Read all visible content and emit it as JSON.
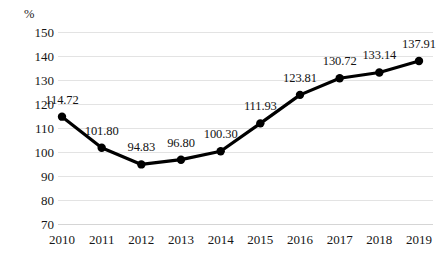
{
  "chart_data": {
    "type": "line",
    "title": "",
    "subtitle": "",
    "xlabel": "",
    "ylabel": "%",
    "unit_label": "%",
    "categories": [
      "2010",
      "2011",
      "2012",
      "2013",
      "2014",
      "2015",
      "2016",
      "2017",
      "2018",
      "2019"
    ],
    "values": [
      114.72,
      101.8,
      94.83,
      96.8,
      100.3,
      111.93,
      123.81,
      130.72,
      133.14,
      137.91
    ],
    "data_labels": [
      "114.72",
      "101.80",
      "94.83",
      "96.80",
      "100.30",
      "111.93",
      "123.81",
      "130.72",
      "133.14",
      "137.91"
    ],
    "ylim": [
      70,
      150
    ],
    "y_ticks": [
      150,
      140,
      130,
      120,
      110,
      100,
      90,
      80,
      70
    ],
    "y_tick_labels": [
      "150",
      "140",
      "130",
      "120",
      "110",
      "100",
      "90",
      "80",
      "70"
    ],
    "grid": true,
    "legend": false,
    "legend_position": "none",
    "series_color": "#000000",
    "grid_color": "#e3e3e3",
    "background_color": "#ffffff",
    "marker": "circle"
  }
}
